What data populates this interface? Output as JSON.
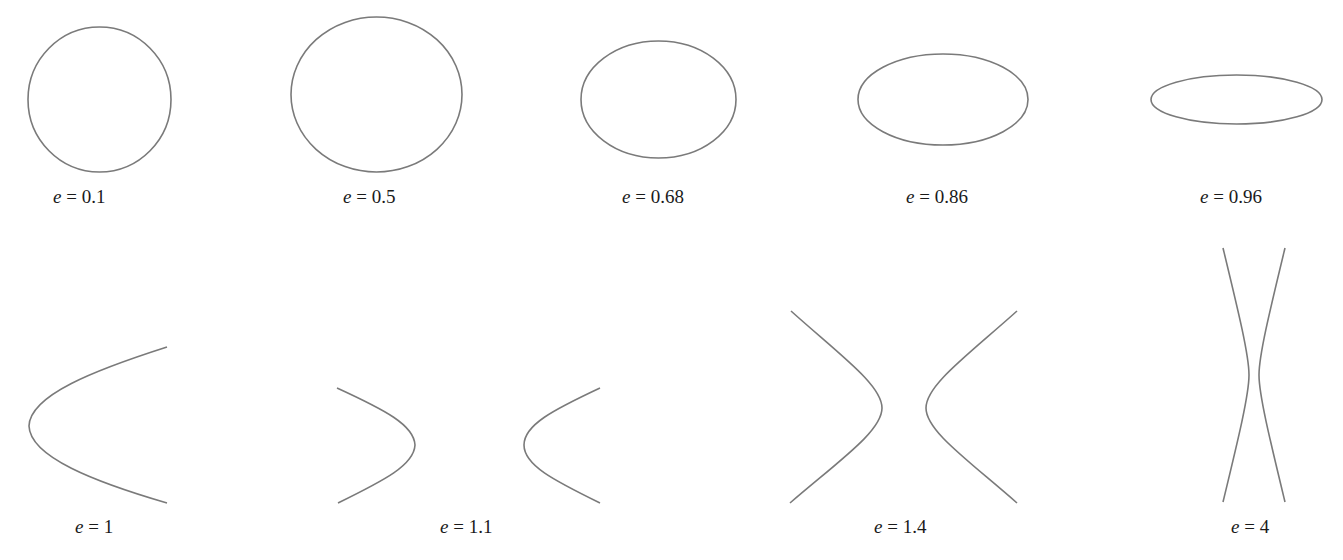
{
  "figure": {
    "stroke_color": "#7a7a7a",
    "text_color": "#1a1a1a",
    "panels": [
      {
        "id": "e-0.1",
        "variable": "e",
        "equals": " = ",
        "value": "0.1",
        "kind": "ellipse"
      },
      {
        "id": "e-0.5",
        "variable": "e",
        "equals": " = ",
        "value": "0.5",
        "kind": "ellipse"
      },
      {
        "id": "e-0.68",
        "variable": "e",
        "equals": " = ",
        "value": "0.68",
        "kind": "ellipse"
      },
      {
        "id": "e-0.86",
        "variable": "e",
        "equals": " = ",
        "value": "0.86",
        "kind": "ellipse"
      },
      {
        "id": "e-0.96",
        "variable": "e",
        "equals": " = ",
        "value": "0.96",
        "kind": "ellipse"
      },
      {
        "id": "e-1",
        "variable": "e",
        "equals": " = ",
        "value": "1",
        "kind": "parabola"
      },
      {
        "id": "e-1.1",
        "variable": "e",
        "equals": " = ",
        "value": "1.1",
        "kind": "hyperbola"
      },
      {
        "id": "e-1.4",
        "variable": "e",
        "equals": " = ",
        "value": "1.4",
        "kind": "hyperbola"
      },
      {
        "id": "e-4",
        "variable": "e",
        "equals": " = ",
        "value": "4",
        "kind": "hyperbola"
      }
    ]
  }
}
